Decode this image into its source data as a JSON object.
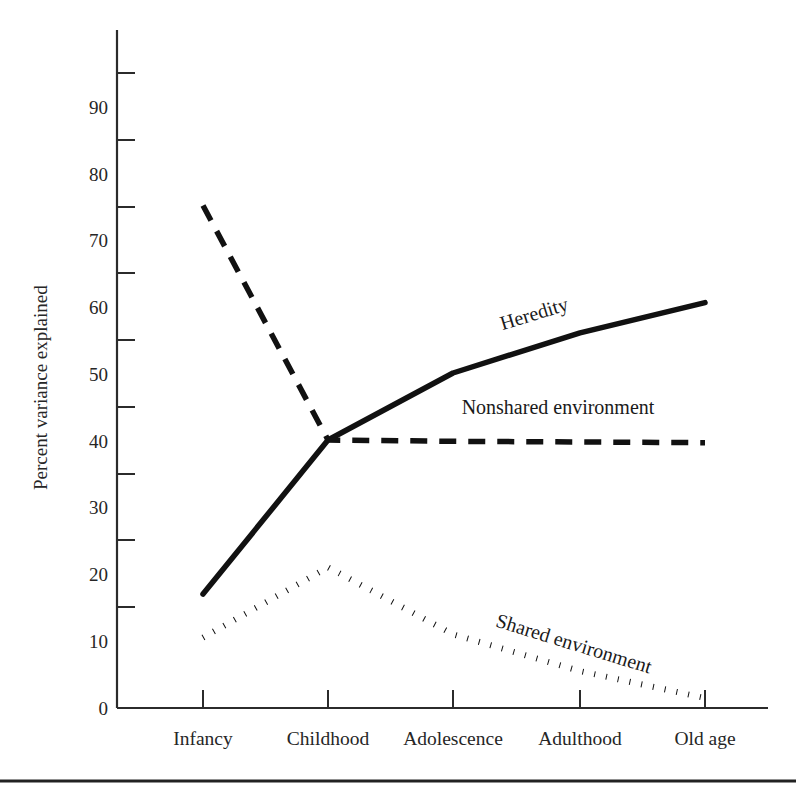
{
  "chart_data": {
    "type": "line",
    "title": "",
    "xlabel": "",
    "ylabel": "Percent variance explained",
    "categories": [
      "Infancy",
      "Childhood",
      "Adolescence",
      "Adulthood",
      "Old age"
    ],
    "ylim": [
      0,
      95
    ],
    "yticks": [
      0,
      10,
      20,
      30,
      40,
      50,
      60,
      70,
      80,
      90
    ],
    "ytick_labels": [
      "0",
      "10",
      "20",
      "30",
      "40",
      "50",
      "60",
      "70",
      "80",
      "90"
    ],
    "grid": false,
    "legend": "inline-labels",
    "series": [
      {
        "name": "Heredity",
        "style": "solid",
        "color": "#111111",
        "values": [
          17,
          40,
          50,
          56,
          60.5
        ],
        "label_text": "Heredity",
        "label_rotation": -17
      },
      {
        "name": "Nonshared environment",
        "style": "dashed",
        "color": "#111111",
        "values": [
          75,
          40,
          39.8,
          39.7,
          39.6
        ],
        "label_text": "Nonshared environment",
        "label_rotation": 0
      },
      {
        "name": "Shared environment",
        "style": "dotted",
        "color": "#111111",
        "values": [
          10.5,
          21,
          11,
          5.5,
          1.5
        ],
        "label_text": "Shared environment",
        "label_rotation": 17
      }
    ]
  },
  "axis": {
    "y_title": "Percent variance explained"
  },
  "footer": {
    "rule": "horizontal-rule"
  }
}
